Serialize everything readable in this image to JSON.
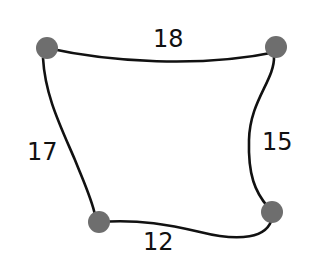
{
  "diagram": {
    "type": "weighted-graph",
    "node_color": "#6e6e6e",
    "edge_color": "#111111",
    "nodes": [
      {
        "id": "top-left",
        "x": 47,
        "y": 48
      },
      {
        "id": "top-right",
        "x": 276,
        "y": 47
      },
      {
        "id": "bottom-right",
        "x": 272,
        "y": 212
      },
      {
        "id": "bottom-left",
        "x": 99,
        "y": 222
      }
    ],
    "edges": [
      {
        "from": "top-left",
        "to": "top-right",
        "label": "18"
      },
      {
        "from": "top-right",
        "to": "bottom-right",
        "label": "15"
      },
      {
        "from": "bottom-right",
        "to": "bottom-left",
        "label": "12"
      },
      {
        "from": "bottom-left",
        "to": "top-left",
        "label": "17"
      }
    ]
  }
}
